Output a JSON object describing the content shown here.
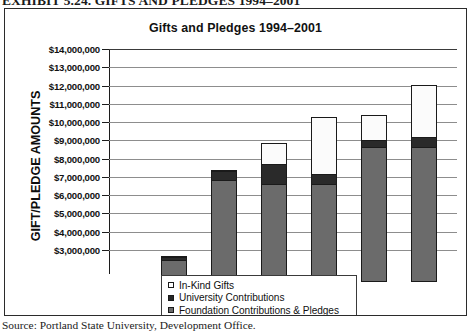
{
  "exhibit": {
    "caption": "EXHIBIT 5.24. GIFTS AND PLEDGES 1994–2001"
  },
  "source": {
    "note": "Source: Portland State University, Development Office."
  },
  "legend": {
    "items": [
      {
        "label": "In-Kind Gifts",
        "swatch": "white",
        "color": "#ffffff"
      },
      {
        "label": "University Contributions",
        "swatch": "black",
        "color": "#262626"
      },
      {
        "label": "Foundation Contributions & Pledges",
        "swatch": "gray",
        "color": "#6b6b6b"
      }
    ]
  },
  "chart_data": {
    "type": "bar",
    "stacked": true,
    "title": "Gifts and Pledges 1994–2001",
    "xlabel": "",
    "ylabel": "GIFT/PLEDGE AMOUNTS",
    "ylim": [
      3000000,
      14000000
    ],
    "grid": true,
    "legend_position": "bottom-center",
    "categories": [
      "1994",
      "1995",
      "1996",
      "1997",
      "1998",
      "1999"
    ],
    "tick_labels": [
      "$14,000,000",
      "$13,000,000",
      "$12,000,000",
      "$11,000,000",
      "$10,000,000",
      "$9,000,000",
      "$8,000,000",
      "$7,000,000",
      "$6,000,000",
      "$5,000,000",
      "$4,000,000",
      "$3,000,000"
    ],
    "tick_values": [
      14000000,
      13000000,
      12000000,
      11000000,
      10000000,
      9000000,
      8000000,
      7000000,
      6000000,
      5000000,
      4000000,
      3000000
    ],
    "series": [
      {
        "name": "Foundation Contributions & Pledges",
        "color": "#6b6b6b",
        "values": [
          3550000,
          7900000,
          7700000,
          7700000,
          9750000,
          9750000
        ]
      },
      {
        "name": "University Contributions",
        "color": "#262626",
        "values": [
          200000,
          600000,
          1150000,
          600000,
          400000,
          600000
        ]
      },
      {
        "name": "In-Kind Gifts",
        "color": "#ffffff",
        "values": [
          0,
          0,
          1100000,
          3100000,
          1350000,
          2750000
        ]
      }
    ],
    "totals": [
      3750000,
      8500000,
      9950000,
      11400000,
      11500000,
      13100000
    ]
  }
}
